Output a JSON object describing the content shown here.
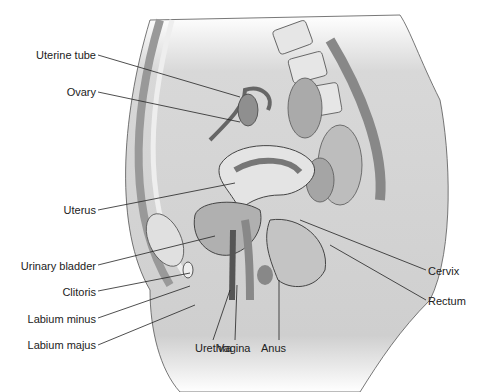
{
  "diagram": {
    "labels_left": [
      {
        "id": "uterine-tube",
        "text": "Uterine tube",
        "x": 96,
        "y": 49,
        "lx1": 98,
        "ly1": 55,
        "lx2": 240,
        "ly2": 97
      },
      {
        "id": "ovary",
        "text": "Ovary",
        "x": 96,
        "y": 86,
        "lx1": 98,
        "ly1": 92,
        "lx2": 240,
        "ly2": 122
      },
      {
        "id": "uterus",
        "text": "Uterus",
        "x": 96,
        "y": 204,
        "lx1": 98,
        "ly1": 210,
        "lx2": 235,
        "ly2": 183
      },
      {
        "id": "urinary-bladder",
        "text": "Urinary bladder",
        "x": 96,
        "y": 260,
        "lx1": 98,
        "ly1": 265,
        "lx2": 215,
        "ly2": 236
      },
      {
        "id": "clitoris",
        "text": "Clitoris",
        "x": 96,
        "y": 286,
        "lx1": 98,
        "ly1": 291,
        "lx2": 190,
        "ly2": 273
      },
      {
        "id": "labium-minus",
        "text": "Labium minus",
        "x": 96,
        "y": 313,
        "lx1": 98,
        "ly1": 318,
        "lx2": 190,
        "ly2": 286
      },
      {
        "id": "labium-majus",
        "text": "Labium majus",
        "x": 96,
        "y": 339,
        "lx1": 98,
        "ly1": 345,
        "lx2": 195,
        "ly2": 305
      }
    ],
    "labels_right": [
      {
        "id": "cervix",
        "text": "Cervix",
        "x": 428,
        "y": 265,
        "lx1": 426,
        "ly1": 270,
        "lx2": 300,
        "ly2": 220
      },
      {
        "id": "rectum",
        "text": "Rectum",
        "x": 428,
        "y": 295,
        "lx1": 426,
        "ly1": 300,
        "lx2": 330,
        "ly2": 245
      }
    ],
    "labels_bottom": [
      {
        "id": "urethra",
        "text": "Urethra",
        "x": 226,
        "y": 342,
        "lx1": 213,
        "ly1": 340,
        "lx2": 230,
        "ly2": 290
      },
      {
        "id": "vagina",
        "text": "Vagina",
        "x": 256,
        "y": 342,
        "lx1": 235,
        "ly1": 340,
        "lx2": 237,
        "ly2": 285
      },
      {
        "id": "anus",
        "text": "Anus",
        "x": 268,
        "y": 342,
        "lx1": 279,
        "ly1": 340,
        "lx2": 279,
        "ly2": 280
      }
    ],
    "colors": {
      "skin": "#d4d4d4",
      "dark": "#8a8a8a",
      "mid": "#b5b5b5",
      "light": "#e8e8e8",
      "line": "#333333"
    }
  }
}
